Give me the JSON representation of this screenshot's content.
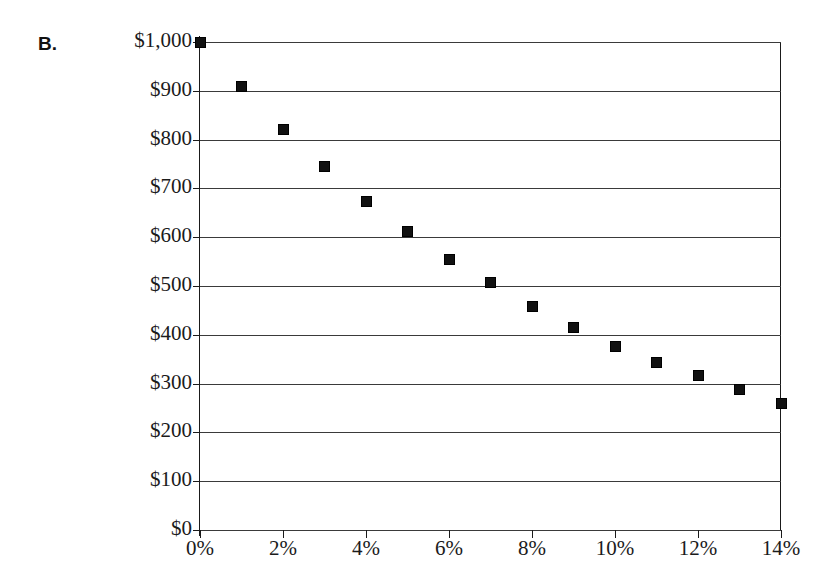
{
  "panel": {
    "label": "B."
  },
  "chart_data": {
    "type": "scatter",
    "title": "",
    "subtitle": "",
    "xlabel": "",
    "ylabel": "",
    "xlim": [
      0,
      14
    ],
    "ylim": [
      0,
      1000
    ],
    "grid": "horizontal",
    "legend": "none",
    "marker": "filled-square",
    "marker_color": "#111111",
    "x": [
      0,
      1,
      2,
      3,
      4,
      5,
      6,
      7,
      8,
      9,
      10,
      11,
      12,
      13,
      14
    ],
    "values": [
      1000,
      908,
      820,
      745,
      674,
      612,
      554,
      507,
      458,
      415,
      377,
      344,
      316,
      287,
      260
    ],
    "x_tick_values": [
      0,
      2,
      4,
      6,
      8,
      10,
      12,
      14
    ],
    "x_tick_labels": [
      "0%",
      "2%",
      "4%",
      "6%",
      "8%",
      "10%",
      "12%",
      "14%"
    ],
    "y_tick_values": [
      0,
      100,
      200,
      300,
      400,
      500,
      600,
      700,
      800,
      900,
      1000
    ],
    "y_tick_labels": [
      "$0",
      "$100",
      "$200",
      "$300",
      "$400",
      "$500",
      "$600",
      "$700",
      "$800",
      "$900",
      "$1,000"
    ],
    "points": [
      {
        "x": "0%",
        "y": 1000
      },
      {
        "x": "1%",
        "y": 908
      },
      {
        "x": "2%",
        "y": 820
      },
      {
        "x": "3%",
        "y": 745
      },
      {
        "x": "4%",
        "y": 674
      },
      {
        "x": "5%",
        "y": 612
      },
      {
        "x": "6%",
        "y": 554
      },
      {
        "x": "7%",
        "y": 507
      },
      {
        "x": "8%",
        "y": 458
      },
      {
        "x": "9%",
        "y": 415
      },
      {
        "x": "10%",
        "y": 377
      },
      {
        "x": "11%",
        "y": 344
      },
      {
        "x": "12%",
        "y": 316
      },
      {
        "x": "13%",
        "y": 287
      },
      {
        "x": "14%",
        "y": 260
      }
    ]
  }
}
